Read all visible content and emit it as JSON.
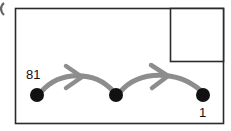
{
  "figure": {
    "type": "state-transition-diagram",
    "background_color": "#ffffff",
    "frame": {
      "name": "outer-frame",
      "x": 15,
      "y": 8,
      "width": 209,
      "height": 116,
      "border_color": "#2b2b2b",
      "fill": "#ffffff"
    },
    "inset_box": {
      "name": "inset-panel",
      "x": 170,
      "y": 8,
      "width": 54,
      "height": 54,
      "border_color": "#2b2b2b",
      "fill": "#ffffff",
      "content": ""
    },
    "edge_artifact": {
      "name": "cropped-arc-fragment",
      "x": 0,
      "y": 3,
      "width": 5,
      "height": 12,
      "color": "#3a3a3a"
    }
  },
  "nodes": [
    {
      "id": "node-1",
      "label": "81",
      "label_position": "above-left",
      "cx": 37,
      "cy": 95,
      "r": 7,
      "color": "#111111"
    },
    {
      "id": "node-2",
      "label": "",
      "label_position": "none",
      "cx": 116,
      "cy": 95,
      "r": 7,
      "color": "#111111"
    },
    {
      "id": "node-3",
      "label": "1",
      "label_position": "below-left",
      "cx": 203,
      "cy": 95,
      "r": 7,
      "color": "#111111"
    }
  ],
  "edges": [
    {
      "id": "edge-1",
      "from": "node-1",
      "to": "node-2",
      "style": "curved-arc",
      "color": "#8d8d8d",
      "stroke_width": 5,
      "arrowhead": "mid",
      "arrowhead_position": {
        "x": 77,
        "y": 77
      }
    },
    {
      "id": "edge-2",
      "from": "node-2",
      "to": "node-3",
      "style": "curved-arc",
      "color": "#8d8d8d",
      "stroke_width": 5,
      "arrowhead": "mid",
      "arrowhead_position": {
        "x": 162,
        "y": 77
      }
    }
  ],
  "labels": {
    "left_value": "81",
    "right_value": "1"
  },
  "colors": {
    "node": "#111111",
    "arrow": "#8d8d8d",
    "border": "#2b2b2b",
    "background": "#ffffff"
  }
}
